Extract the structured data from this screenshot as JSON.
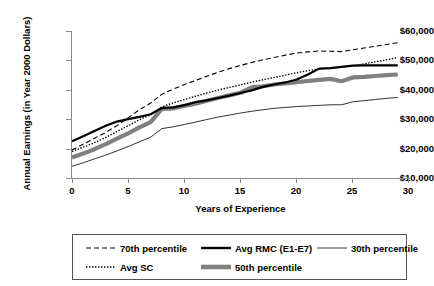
{
  "chart_data": {
    "type": "line",
    "title": "",
    "xlabel": "Years of Experience",
    "ylabel": "Annual Earnings (in Year 2000 Dollars)",
    "xlim": [
      0,
      30
    ],
    "ylim": [
      10000,
      60000
    ],
    "grid": false,
    "legend_position": "bottom",
    "xticks": [
      "0",
      "5",
      "10",
      "15",
      "20",
      "25",
      "30"
    ],
    "xtick_values": [
      0,
      5,
      10,
      15,
      20,
      25,
      30
    ],
    "yticks": [
      "$10,000",
      "$20,000",
      "$30,000",
      "$40,000",
      "$50,000",
      "$60,000"
    ],
    "ytick_values": [
      10000,
      20000,
      30000,
      40000,
      50000,
      60000
    ],
    "x": [
      0,
      1,
      2,
      3,
      4,
      5,
      6,
      7,
      8,
      9,
      10,
      11,
      12,
      13,
      14,
      15,
      16,
      17,
      18,
      19,
      20,
      21,
      22,
      23,
      24,
      25,
      26,
      27,
      28,
      29
    ],
    "series": [
      {
        "name": "70th percentile",
        "style": "dashed",
        "color": "#000000",
        "width": 1.1,
        "values": [
          19500,
          21500,
          23500,
          25500,
          27800,
          30500,
          33200,
          35500,
          38500,
          40200,
          41800,
          43200,
          44600,
          46000,
          47200,
          48300,
          49300,
          50200,
          51000,
          51800,
          52500,
          52900,
          53200,
          53100,
          53000,
          53600,
          54200,
          54800,
          55400,
          56000
        ]
      },
      {
        "name": "Avg SC",
        "style": "dotted",
        "color": "#000000",
        "width": 1.4,
        "values": [
          19000,
          20500,
          22000,
          23800,
          25800,
          27800,
          29800,
          31500,
          34200,
          35500,
          36700,
          37800,
          38900,
          39900,
          40800,
          41700,
          42600,
          43400,
          44200,
          45000,
          45800,
          46500,
          47100,
          47400,
          47700,
          48200,
          48800,
          49500,
          50200,
          51000
        ]
      },
      {
        "name": "Avg RMC (E1-E7)",
        "style": "solid",
        "color": "#000000",
        "width": 2.2,
        "values": [
          22500,
          24200,
          26000,
          27800,
          29200,
          30000,
          30800,
          31700,
          33800,
          34000,
          34800,
          35800,
          36400,
          37200,
          38000,
          38900,
          39800,
          41000,
          41800,
          42500,
          43500,
          45200,
          47200,
          47400,
          47800,
          48200,
          48300,
          48300,
          48300,
          48300
        ]
      },
      {
        "name": "50th percentile",
        "style": "thick",
        "color": "#808080",
        "width": 4.2,
        "values": [
          17000,
          18300,
          19800,
          21500,
          23400,
          25200,
          27200,
          29000,
          33500,
          33700,
          34500,
          35300,
          36300,
          37200,
          38100,
          39000,
          40800,
          41200,
          41800,
          42200,
          42600,
          43000,
          43400,
          43700,
          42900,
          44200,
          44400,
          44700,
          45000,
          45200
        ]
      },
      {
        "name": "30th percentile",
        "style": "thin",
        "color": "#000000",
        "width": 0.8,
        "values": [
          14000,
          15200,
          16500,
          17800,
          19200,
          20700,
          22300,
          23900,
          26800,
          27400,
          28200,
          29000,
          29900,
          30700,
          31400,
          32100,
          32700,
          33200,
          33700,
          34000,
          34300,
          34500,
          34700,
          34900,
          34900,
          35900,
          36300,
          36700,
          37100,
          37400
        ]
      }
    ]
  },
  "axes": {
    "y_title": "Annual Earnings (in Year 2000 Dollars)",
    "x_title": "Years of Experience",
    "y_labels": [
      "$60,000",
      "$50,000",
      "$40,000",
      "$30,000",
      "$20,000",
      "$10,000"
    ],
    "x_labels": [
      "0",
      "5",
      "10",
      "15",
      "20",
      "25",
      "30"
    ]
  },
  "legend": {
    "entries": [
      {
        "label": "70th percentile",
        "swatch": "dashed-line-swatch"
      },
      {
        "label": "Avg RMC (E1-E7)",
        "swatch": "thick-solid-line-swatch"
      },
      {
        "label": "30th percentile",
        "swatch": "thin-solid-line-swatch"
      },
      {
        "label": "Avg SC",
        "swatch": "dotted-line-swatch"
      },
      {
        "label": "50th percentile",
        "swatch": "very-thick-gray-line-swatch"
      }
    ]
  },
  "colors": {
    "axis": "#888888",
    "line": "#000000",
    "median_band": "#808080",
    "legend_border": "#555555",
    "background": "#ffffff"
  }
}
